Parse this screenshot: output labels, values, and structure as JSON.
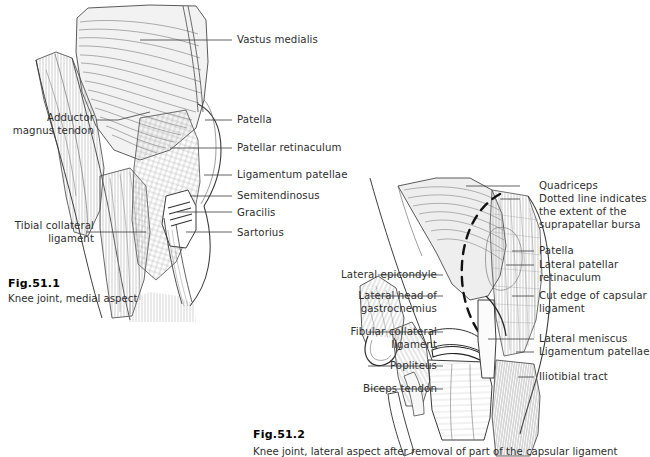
{
  "page": {
    "background_color": "#ffffff",
    "text_color": "#2e2e2e",
    "line_color": "#3a3a3a",
    "width": 650,
    "height": 457
  },
  "figures": [
    {
      "id": "fig-51-1",
      "caption_number": "Fig.51.1",
      "caption_text": "Knee joint, medial aspect",
      "labels_left": [
        {
          "name": "adductor-magnus-tendon",
          "text": "Adductor\nmagnus tendon"
        },
        {
          "name": "tibial-collateral-ligament",
          "text": "Tibial collateral\nligament"
        }
      ],
      "labels_right": [
        {
          "name": "vastus-medialis",
          "text": "Vastus medialis"
        },
        {
          "name": "patella",
          "text": "Patella"
        },
        {
          "name": "patellar-retinaculum",
          "text": "Patellar retinaculum"
        },
        {
          "name": "ligamentum-patellae",
          "text": "Ligamentum patellae"
        },
        {
          "name": "semitendinosus",
          "text": "Semitendinosus"
        },
        {
          "name": "gracilis",
          "text": "Gracilis"
        },
        {
          "name": "sartorius",
          "text": "Sartorius"
        }
      ]
    },
    {
      "id": "fig-51-2",
      "caption_number": "Fig.51.2",
      "caption_text": "Knee joint, lateral aspect after removal of part of the capsular ligament",
      "labels_left": [
        {
          "name": "lateral-epicondyle",
          "text": "Lateral epicondyle"
        },
        {
          "name": "lateral-head-of-gastrocnemius",
          "text": "Lateral head of\ngastrocnemius"
        },
        {
          "name": "fibular-collateral-ligament",
          "text": "Fibular collateral\nligament"
        },
        {
          "name": "popliteus",
          "text": "Popliteus"
        },
        {
          "name": "biceps-tendon",
          "text": "Biceps tendon"
        }
      ],
      "labels_right": [
        {
          "name": "quadriceps",
          "text": "Quadriceps"
        },
        {
          "name": "suprapatellar-bursa-note",
          "text": "Dotted line indicates\nthe extent of the\nsuprapatellar bursa"
        },
        {
          "name": "patella",
          "text": "Patella"
        },
        {
          "name": "lateral-patellar-retinaculum",
          "text": "Lateral patellar\nretinaculum"
        },
        {
          "name": "cut-edge-of-capsular-ligament",
          "text": "Cut edge of capsular\nligament"
        },
        {
          "name": "lateral-meniscus",
          "text": "Lateral meniscus"
        },
        {
          "name": "ligamentum-patellae",
          "text": "Ligamentum patellae"
        },
        {
          "name": "iliotibial-tract",
          "text": "Iliotibial tract"
        }
      ]
    }
  ]
}
